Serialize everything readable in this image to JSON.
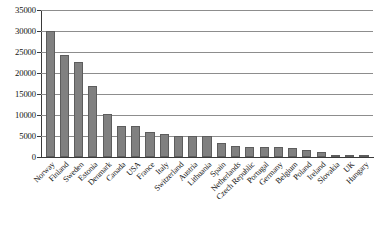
{
  "chart_data": {
    "type": "bar",
    "title": "",
    "xlabel": "",
    "ylabel": "",
    "ylim": [
      0,
      35000
    ],
    "yticks": [
      0,
      5000,
      10000,
      15000,
      20000,
      25000,
      30000,
      35000
    ],
    "ytick_labels": [
      "0",
      "5000",
      "10000",
      "15000",
      "20000",
      "25000",
      "30000",
      "35000"
    ],
    "grid": true,
    "legend": "none",
    "bar_color": "#808080",
    "bar_edge_color": "#5d5d5d",
    "gridline_color": "#8d8d8d",
    "axis_color": "#3a3a3a",
    "xtick_rotation": -45,
    "categories": [
      "Norway",
      "Finland",
      "Sweden",
      "Estonia",
      "Denmark",
      "Canada",
      "USA",
      "France",
      "Italy",
      "Switzerland",
      "Austria",
      "Lithuania",
      "Spain",
      "Netherlands",
      "Czech Republic",
      "Portugal",
      "Germany",
      "Belgium",
      "Poland",
      "Ireland",
      "Slovakia",
      "UK",
      "Hungary"
    ],
    "values": [
      29900,
      24200,
      22600,
      17000,
      10300,
      7500,
      7400,
      5900,
      5500,
      5100,
      5000,
      4900,
      3300,
      2600,
      2500,
      2400,
      2300,
      2100,
      1700,
      1200,
      500,
      400,
      300
    ]
  }
}
